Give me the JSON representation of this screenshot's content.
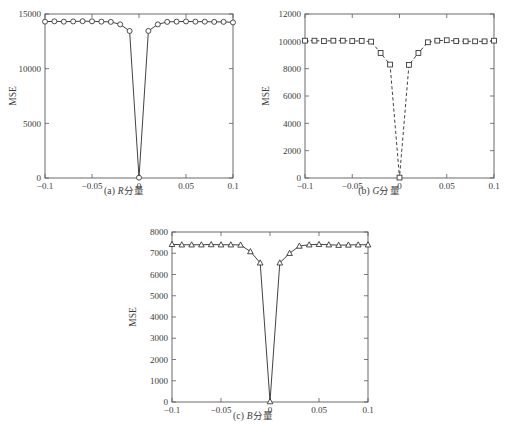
{
  "figure": {
    "background": "#ffffff",
    "line_color": "#2d2d2d",
    "axis_color": "#5a5a5a",
    "panels": [
      {
        "id": "a",
        "caption_index": "(a)",
        "caption_symbol": "R",
        "caption_suffix": "分量",
        "caption_full": "(a) R分量"
      },
      {
        "id": "b",
        "caption_index": "(b)",
        "caption_symbol": "G",
        "caption_suffix": "分量",
        "caption_full": "(b) G分量"
      },
      {
        "id": "c",
        "caption_index": "(c)",
        "caption_symbol": "B",
        "caption_suffix": "分量",
        "caption_full": "(c) B分量"
      }
    ]
  },
  "chart_data": [
    {
      "type": "line",
      "id": "panel-a",
      "title": "(a) R分量",
      "xlabel": "β",
      "ylabel": "MSE",
      "xlim": [
        -0.1,
        0.1
      ],
      "ylim": [
        0,
        15000
      ],
      "xticks": [
        -0.1,
        -0.05,
        0,
        0.05,
        0.1
      ],
      "xticklabels": [
        "-0.1",
        "-0.05",
        "0",
        "0.05",
        "0.1"
      ],
      "yticks": [
        0,
        5000,
        10000,
        15000
      ],
      "yticklabels": [
        "0",
        "5000",
        "10000",
        "15000"
      ],
      "grid": false,
      "legend": "none",
      "linestyle": "solid",
      "marker": "circle",
      "x": [
        -0.1,
        -0.09,
        -0.08,
        -0.07,
        -0.06,
        -0.05,
        -0.04,
        -0.03,
        -0.02,
        -0.01,
        0,
        0.01,
        0.02,
        0.03,
        0.04,
        0.05,
        0.06,
        0.07,
        0.08,
        0.09,
        0.1
      ],
      "values": [
        14300,
        14330,
        14300,
        14320,
        14340,
        14330,
        14300,
        14280,
        14050,
        13450,
        30,
        13450,
        14050,
        14280,
        14300,
        14320,
        14300,
        14300,
        14280,
        14280,
        14230
      ]
    },
    {
      "type": "line",
      "id": "panel-b",
      "title": "(b) G分量",
      "xlabel": "β",
      "ylabel": "MSE",
      "xlim": [
        -0.1,
        0.1
      ],
      "ylim": [
        0,
        12000
      ],
      "xticks": [
        -0.1,
        -0.05,
        0,
        0.05,
        0.1
      ],
      "xticklabels": [
        "-0.1",
        "-0.05",
        "0",
        "0.05",
        "0.1"
      ],
      "yticks": [
        0,
        2000,
        4000,
        6000,
        8000,
        10000,
        12000
      ],
      "yticklabels": [
        "0",
        "2000",
        "4000",
        "6000",
        "8000",
        "10000",
        "12000"
      ],
      "grid": false,
      "legend": "none",
      "linestyle": "dashed",
      "marker": "square",
      "x": [
        -0.1,
        -0.09,
        -0.08,
        -0.07,
        -0.06,
        -0.05,
        -0.04,
        -0.03,
        -0.02,
        -0.01,
        0,
        0.01,
        0.02,
        0.03,
        0.04,
        0.05,
        0.06,
        0.07,
        0.08,
        0.09,
        0.1
      ],
      "values": [
        10050,
        10050,
        10020,
        10050,
        10050,
        10020,
        10030,
        9980,
        9150,
        8300,
        30,
        8280,
        9150,
        9930,
        10050,
        10080,
        10020,
        10000,
        10000,
        10000,
        10050
      ]
    },
    {
      "type": "line",
      "id": "panel-c",
      "title": "(c) B分量",
      "xlabel": "β",
      "ylabel": "MSE",
      "xlim": [
        -0.1,
        0.1
      ],
      "ylim": [
        0,
        8000
      ],
      "xticks": [
        -0.1,
        -0.05,
        0,
        0.05,
        0.1
      ],
      "xticklabels": [
        "-0.1",
        "-0.05",
        "0",
        "0.05",
        "0.1"
      ],
      "yticks": [
        0,
        1000,
        2000,
        3000,
        4000,
        5000,
        6000,
        7000,
        8000
      ],
      "yticklabels": [
        "0",
        "1000",
        "2000",
        "3000",
        "4000",
        "5000",
        "6000",
        "7000",
        "8000"
      ],
      "grid": false,
      "legend": "none",
      "linestyle": "solid",
      "marker": "triangle",
      "x": [
        -0.1,
        -0.09,
        -0.08,
        -0.07,
        -0.06,
        -0.05,
        -0.04,
        -0.03,
        -0.02,
        -0.01,
        0,
        0.01,
        0.02,
        0.03,
        0.04,
        0.05,
        0.06,
        0.07,
        0.08,
        0.09,
        0.1
      ],
      "values": [
        7420,
        7400,
        7400,
        7400,
        7410,
        7400,
        7400,
        7390,
        7080,
        6550,
        20,
        6550,
        7000,
        7340,
        7400,
        7420,
        7400,
        7380,
        7390,
        7400,
        7400
      ]
    }
  ]
}
